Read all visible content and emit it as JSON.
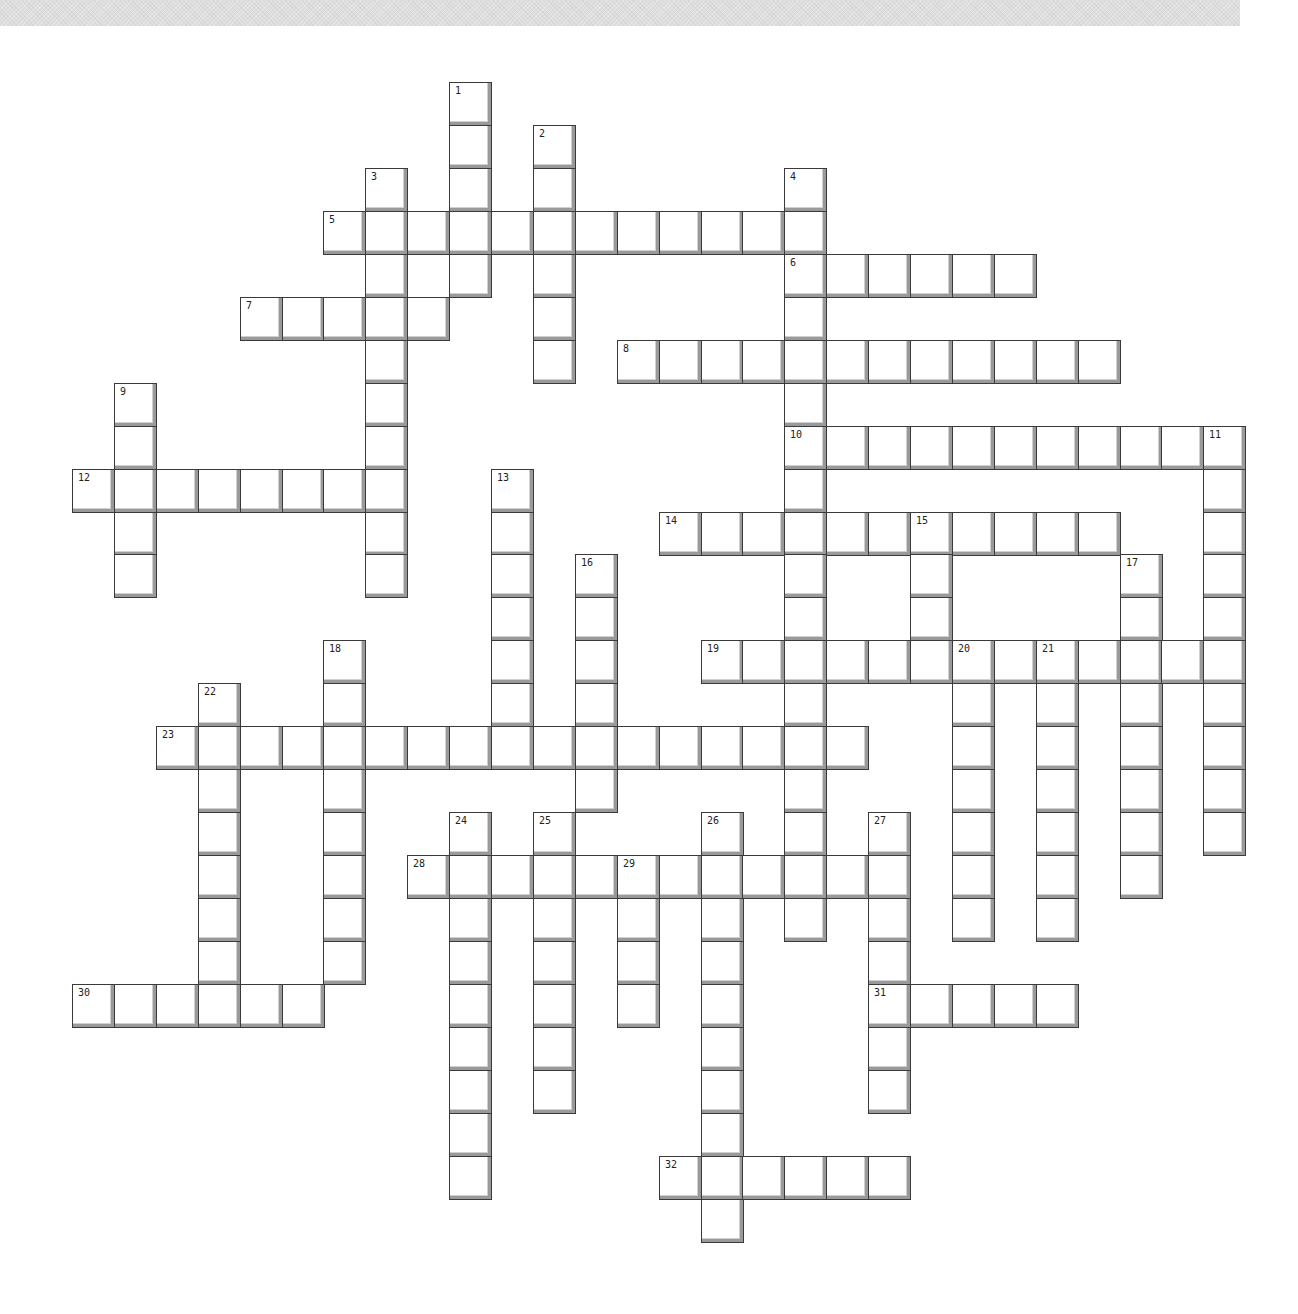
{
  "puzzle": {
    "type": "crossword",
    "grid_origin_px": {
      "x": 72,
      "y": 82
    },
    "cell_pitch_px": {
      "x": 41.9,
      "y": 42.95
    },
    "colors": {
      "background": "#ffffff",
      "cell_border": "#3a3a3a",
      "cell_shadow": "#9a9a9a",
      "top_band": "#dedede"
    },
    "across": [
      {
        "number": "5",
        "row": 3,
        "col": 6,
        "length": 12
      },
      {
        "number": "6",
        "row": 4,
        "col": 17,
        "length": 6
      },
      {
        "number": "7",
        "row": 5,
        "col": 4,
        "length": 5
      },
      {
        "number": "8",
        "row": 6,
        "col": 13,
        "length": 12
      },
      {
        "number": "10",
        "row": 8,
        "col": 17,
        "length": 11
      },
      {
        "number": "12",
        "row": 9,
        "col": 0,
        "length": 8
      },
      {
        "number": "14",
        "row": 10,
        "col": 14,
        "length": 11
      },
      {
        "number": "19",
        "row": 13,
        "col": 15,
        "length": 13
      },
      {
        "number": "23",
        "row": 15,
        "col": 2,
        "length": 17
      },
      {
        "number": "28",
        "row": 18,
        "col": 8,
        "length": 12
      },
      {
        "number": "30",
        "row": 21,
        "col": 0,
        "length": 6
      },
      {
        "number": "31",
        "row": 21,
        "col": 19,
        "length": 5
      },
      {
        "number": "32",
        "row": 25,
        "col": 14,
        "length": 6
      }
    ],
    "down": [
      {
        "number": "1",
        "row": 0,
        "col": 9,
        "length": 5
      },
      {
        "number": "2",
        "row": 1,
        "col": 11,
        "length": 6
      },
      {
        "number": "3",
        "row": 2,
        "col": 7,
        "length": 10
      },
      {
        "number": "4",
        "row": 2,
        "col": 17,
        "length": 18
      },
      {
        "number": "9",
        "row": 7,
        "col": 1,
        "length": 5
      },
      {
        "number": "11",
        "row": 8,
        "col": 27,
        "length": 10
      },
      {
        "number": "13",
        "row": 9,
        "col": 10,
        "length": 7
      },
      {
        "number": "15",
        "row": 10,
        "col": 20,
        "length": 4
      },
      {
        "number": "16",
        "row": 11,
        "col": 12,
        "length": 6
      },
      {
        "number": "17",
        "row": 11,
        "col": 25,
        "length": 8
      },
      {
        "number": "18",
        "row": 13,
        "col": 6,
        "length": 8
      },
      {
        "number": "20",
        "row": 13,
        "col": 21,
        "length": 7
      },
      {
        "number": "21",
        "row": 13,
        "col": 23,
        "length": 7
      },
      {
        "number": "22",
        "row": 14,
        "col": 3,
        "length": 8
      },
      {
        "number": "24",
        "row": 17,
        "col": 9,
        "length": 9
      },
      {
        "number": "25",
        "row": 17,
        "col": 11,
        "length": 7
      },
      {
        "number": "26",
        "row": 17,
        "col": 15,
        "length": 10
      },
      {
        "number": "27",
        "row": 17,
        "col": 19,
        "length": 7
      },
      {
        "number": "29",
        "row": 18,
        "col": 13,
        "length": 4
      }
    ]
  }
}
